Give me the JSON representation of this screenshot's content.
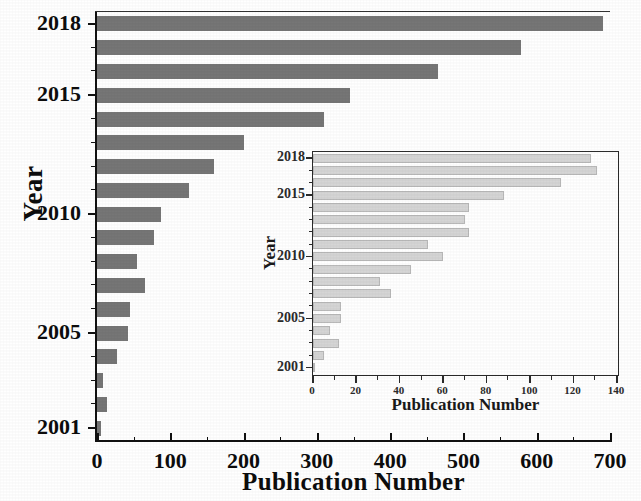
{
  "chart_data": [
    {
      "id": "main",
      "type": "bar",
      "orientation": "horizontal",
      "title": "",
      "xlabel": "Publication Number",
      "ylabel": "Year",
      "categories": [
        "2001",
        "2002",
        "2003",
        "2004",
        "2005",
        "2006",
        "2007",
        "2008",
        "2009",
        "2010",
        "2011",
        "2012",
        "2013",
        "2014",
        "2015",
        "2016",
        "2017",
        "2018"
      ],
      "values": [
        6,
        13,
        8,
        27,
        42,
        45,
        65,
        55,
        78,
        88,
        125,
        160,
        200,
        310,
        345,
        465,
        578,
        690
      ],
      "xlim": [
        0,
        700
      ],
      "xticks": [
        0,
        100,
        200,
        300,
        400,
        500,
        600,
        700
      ],
      "xtick_labels": [
        "0",
        "100",
        "200",
        "300",
        "400",
        "500",
        "600",
        "700"
      ],
      "xminor_step": 50,
      "ytick_labels": [
        "2001",
        "2005",
        "2010",
        "2015",
        "2018"
      ],
      "grid": false,
      "legend": false,
      "bar_color": "#767676"
    },
    {
      "id": "inset",
      "type": "bar",
      "orientation": "horizontal",
      "title": "",
      "xlabel": "Publication Number",
      "ylabel": "Year",
      "categories": [
        "2001",
        "2002",
        "2003",
        "2004",
        "2005",
        "2006",
        "2007",
        "2008",
        "2009",
        "2010",
        "2011",
        "2012",
        "2013",
        "2014",
        "2015",
        "2016",
        "2017",
        "2018"
      ],
      "values": [
        1,
        5,
        12,
        8,
        13,
        13,
        36,
        31,
        45,
        60,
        53,
        72,
        70,
        72,
        88,
        114,
        131,
        128
      ],
      "xlim": [
        0,
        140
      ],
      "xticks": [
        0,
        20,
        40,
        60,
        80,
        100,
        120,
        140
      ],
      "xtick_labels": [
        "0",
        "20",
        "40",
        "60",
        "80",
        "100",
        "120",
        "140"
      ],
      "xminor_step": 10,
      "ytick_labels": [
        "2001",
        "2005",
        "2010",
        "2015",
        "2018"
      ],
      "grid": false,
      "legend": false,
      "bar_color": "#d5d5d5"
    }
  ],
  "main": {
    "xlabel": "Publication Number",
    "ylabel": "Year"
  },
  "inset": {
    "xlabel": "Publication Number",
    "ylabel": "Year"
  }
}
